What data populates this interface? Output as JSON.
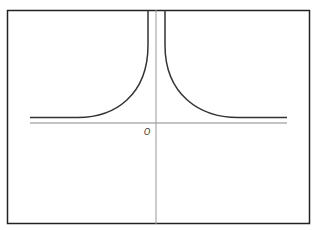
{
  "diagram": {
    "type": "function-graph",
    "origin_label": "O",
    "colors": {
      "frame": "#222222",
      "curve": "#333333",
      "axis": "#888888",
      "background": "#ffffff"
    }
  }
}
